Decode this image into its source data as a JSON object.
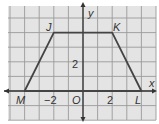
{
  "diagram": {
    "type": "coordinate-plane-trapezoid",
    "axes": {
      "x_label": "x",
      "y_label": "y",
      "origin_label": "O"
    },
    "tick_labels": {
      "x_neg": "−2",
      "x_pos": "2",
      "y_pos": "2"
    },
    "vertices": [
      {
        "name": "J",
        "x": -2,
        "y": 4
      },
      {
        "name": "K",
        "x": 2,
        "y": 4
      },
      {
        "name": "L",
        "x": 4,
        "y": 0
      },
      {
        "name": "M",
        "x": -4,
        "y": 0
      }
    ],
    "labels": {
      "J": "J",
      "K": "K",
      "L": "L",
      "M": "M"
    },
    "colors": {
      "grid_bg": "#e6e6e6",
      "grid_line": "#9a9a9a",
      "shape": "#444444",
      "axis": "#333333"
    }
  }
}
